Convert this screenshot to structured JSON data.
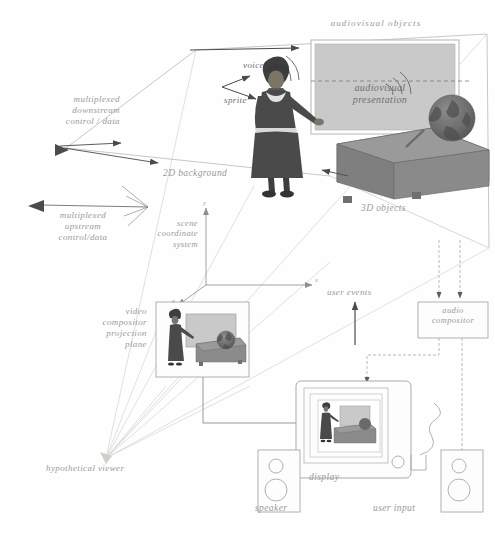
{
  "diagram": {
    "type": "system-architecture-perspective-diagram",
    "palette": {
      "ink": "#8e8e8a",
      "label": "#9a9a96",
      "label_dark": "#6f6f6c",
      "screen_fill": "#c9c9c9",
      "desk_fill": "#8b8b8b",
      "desk_top": "#7d7d7d",
      "figure_fill": "#5a5a5a",
      "globe_fill": "#6a6a6a",
      "background": "#fefefe",
      "arrow": "#555555",
      "box_stroke": "#b4b4b0",
      "perspective_line": "#cfcfcb"
    }
  },
  "labels": {
    "audiovisual_objects": "audiovisual objects",
    "audiovisual_presentation": "audiovisual\npresentation",
    "voice": "voice",
    "sprite": "sprite",
    "two_d_background": "2D background",
    "three_d_objects": "3D objects",
    "multiplexed_downstream": "multiplexed\ndownstream\ncontrol / data",
    "multiplexed_upstream": "multiplexed\nupstream\ncontrol/data",
    "scene_coordinate_system": "scene\ncoordinate\nsystem",
    "video_compositor": "video\ncompositor\nprojection\nplane",
    "hypothetical_viewer": "hypothetical viewer",
    "user_events": "user events",
    "audio_compositor": "audio\ncompositor",
    "display": "display",
    "speaker": "speaker",
    "user_input": "user input"
  },
  "axes": {
    "y": "y",
    "x": "x",
    "z": "z"
  },
  "nodes": [
    {
      "id": "presentation-screen",
      "label": "audiovisual presentation",
      "kind": "screen"
    },
    {
      "id": "sprite-figure",
      "label": "sprite",
      "kind": "3d-figure"
    },
    {
      "id": "desk",
      "label": "3D objects",
      "kind": "3d-object"
    },
    {
      "id": "globe",
      "label": "3D objects",
      "kind": "3d-object"
    },
    {
      "id": "video-compositor-plane",
      "label": "video compositor projection plane",
      "kind": "plane"
    },
    {
      "id": "audio-compositor",
      "label": "audio compositor",
      "kind": "box"
    },
    {
      "id": "display",
      "label": "display",
      "kind": "device"
    },
    {
      "id": "speaker-left",
      "label": "speaker",
      "kind": "device"
    },
    {
      "id": "speaker-right",
      "label": "speaker",
      "kind": "device"
    },
    {
      "id": "user-input",
      "label": "user input",
      "kind": "device"
    }
  ],
  "flows": [
    {
      "from": "multiplexed downstream control / data",
      "to": "scene"
    },
    {
      "from": "scene",
      "to": "multiplexed upstream control/data"
    },
    {
      "from": "video compositor projection plane",
      "to": "display"
    },
    {
      "from": "audio compositor",
      "to": "speaker"
    },
    {
      "from": "user input",
      "to": "user events"
    }
  ]
}
